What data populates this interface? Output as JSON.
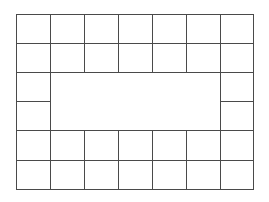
{
  "diagram": {
    "type": "grid-frame",
    "columns": 7,
    "rows": 6,
    "line_color": "#4a4a4a",
    "background": "#ffffff",
    "x_lines": [
      16,
      50,
      84,
      118,
      152,
      186,
      220,
      253
    ],
    "y_lines": [
      14,
      43,
      72,
      101,
      130,
      160,
      189
    ],
    "cells": [
      {
        "row": 0,
        "col": 0
      },
      {
        "row": 0,
        "col": 1
      },
      {
        "row": 0,
        "col": 2
      },
      {
        "row": 0,
        "col": 3
      },
      {
        "row": 0,
        "col": 4
      },
      {
        "row": 0,
        "col": 5
      },
      {
        "row": 0,
        "col": 6
      },
      {
        "row": 1,
        "col": 0
      },
      {
        "row": 1,
        "col": 1
      },
      {
        "row": 1,
        "col": 2
      },
      {
        "row": 1,
        "col": 3
      },
      {
        "row": 1,
        "col": 4
      },
      {
        "row": 1,
        "col": 5
      },
      {
        "row": 1,
        "col": 6
      },
      {
        "row": 2,
        "col": 0
      },
      {
        "row": 2,
        "col": 6
      },
      {
        "row": 3,
        "col": 0
      },
      {
        "row": 3,
        "col": 6
      },
      {
        "row": 4,
        "col": 0
      },
      {
        "row": 4,
        "col": 1
      },
      {
        "row": 4,
        "col": 2
      },
      {
        "row": 4,
        "col": 3
      },
      {
        "row": 4,
        "col": 4
      },
      {
        "row": 4,
        "col": 5
      },
      {
        "row": 4,
        "col": 6
      },
      {
        "row": 5,
        "col": 0
      },
      {
        "row": 5,
        "col": 1
      },
      {
        "row": 5,
        "col": 2
      },
      {
        "row": 5,
        "col": 3
      },
      {
        "row": 5,
        "col": 4
      },
      {
        "row": 5,
        "col": 5
      },
      {
        "row": 5,
        "col": 6
      }
    ],
    "empty_region": {
      "row_start": 2,
      "row_end": 3,
      "col_start": 1,
      "col_end": 5
    }
  }
}
